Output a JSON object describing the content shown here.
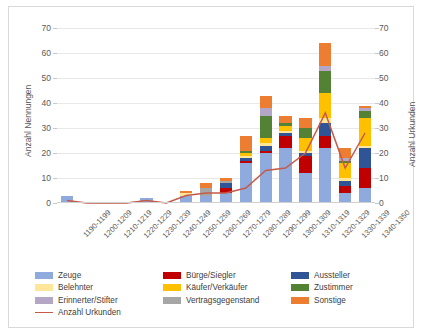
{
  "chart_data": {
    "type": "bar",
    "stacked": true,
    "title": "",
    "xlabel": "",
    "ylabel": "Anzahl Nennungen",
    "y2label": "Anzahl Urkunden",
    "ylim": [
      0,
      70
    ],
    "y2lim": [
      0,
      70
    ],
    "yticks": [
      0,
      10,
      20,
      30,
      40,
      50,
      60,
      70
    ],
    "y2ticks": [
      0,
      10,
      20,
      30,
      40,
      50,
      60,
      70
    ],
    "grid": true,
    "legend_position": "bottom",
    "categories": [
      "1190-1199",
      "1200-1209",
      "1210-1219",
      "1220-1229",
      "1230-1239",
      "1240-1249",
      "1250-1259",
      "1260-1269",
      "1270-1279",
      "1280-1289",
      "1290-1299",
      "1300-1309",
      "1310-1319",
      "1320-1329",
      "1330-1339",
      "1340-1350"
    ],
    "series": [
      {
        "name": "Zeuge",
        "color": "#8FAADC",
        "values": [
          3,
          0,
          0,
          0,
          2,
          0,
          3,
          3,
          4,
          16,
          20,
          22,
          12,
          22,
          4,
          6
        ]
      },
      {
        "name": "Bürge/Siegler",
        "color": "#C00000",
        "values": [
          0,
          0,
          0,
          0,
          0,
          0,
          0,
          0,
          2,
          1,
          1,
          5,
          7,
          5,
          3,
          8
        ]
      },
      {
        "name": "Aussteller",
        "color": "#2F5597",
        "values": [
          0,
          0,
          0,
          0,
          0,
          0,
          0,
          0,
          2,
          1,
          2,
          1,
          1,
          5,
          2,
          8
        ]
      },
      {
        "name": "Belehnter",
        "color": "#FFE699",
        "values": [
          0,
          0,
          0,
          0,
          0,
          0,
          1,
          0,
          0,
          1,
          1,
          1,
          1,
          2,
          1,
          1
        ]
      },
      {
        "name": "Käufer/Verkäufer",
        "color": "#FFC000",
        "values": [
          0,
          0,
          0,
          0,
          0,
          0,
          0,
          0,
          0,
          1,
          2,
          2,
          5,
          10,
          6,
          11
        ]
      },
      {
        "name": "Zustimmer",
        "color": "#548235",
        "values": [
          0,
          0,
          0,
          0,
          0,
          0,
          0,
          0,
          0,
          1,
          9,
          1,
          4,
          9,
          1,
          3
        ]
      },
      {
        "name": "Erinnerter/Stifter",
        "color": "#B4A7C6",
        "values": [
          0,
          0,
          0,
          0,
          0,
          0,
          0,
          0,
          0,
          0,
          3,
          0,
          0,
          2,
          1,
          1
        ]
      },
      {
        "name": "Vertragsgegenstand",
        "color": "#A6A6A6",
        "values": [
          0,
          0,
          0,
          0,
          0,
          0,
          0,
          3,
          1,
          0,
          0,
          0,
          0,
          0,
          0,
          0
        ]
      },
      {
        "name": "Sonstige",
        "color": "#ED7D31",
        "values": [
          0,
          0,
          0,
          0,
          0,
          0,
          1,
          2,
          1,
          6,
          5,
          3,
          4,
          9,
          4,
          1
        ]
      }
    ],
    "line_series": {
      "name": "Anzahl Urkunden",
      "color": "#C55A4A",
      "values": [
        1,
        0,
        0,
        0,
        1,
        0,
        3,
        4,
        4,
        6,
        13,
        14,
        20,
        36,
        14,
        28
      ]
    }
  },
  "legend": {
    "items": [
      {
        "label": "Zeuge",
        "color": "#8FAADC",
        "type": "swatch"
      },
      {
        "label": "Bürge/Siegler",
        "color": "#C00000",
        "type": "swatch"
      },
      {
        "label": "Aussteller",
        "color": "#2F5597",
        "type": "swatch"
      },
      {
        "label": "Belehnter",
        "color": "#FFE699",
        "type": "swatch"
      },
      {
        "label": "Käufer/Verkäufer",
        "color": "#FFC000",
        "type": "swatch"
      },
      {
        "label": "Zustimmer",
        "color": "#548235",
        "type": "swatch"
      },
      {
        "label": "Erinnerter/Stifter",
        "color": "#B4A7C6",
        "type": "swatch"
      },
      {
        "label": "Vertragsgegenstand",
        "color": "#A6A6A6",
        "type": "swatch"
      },
      {
        "label": "Sonstige",
        "color": "#ED7D31",
        "type": "swatch"
      },
      {
        "label": "Anzahl Urkunden",
        "color": "#C55A4A",
        "type": "line"
      }
    ]
  }
}
